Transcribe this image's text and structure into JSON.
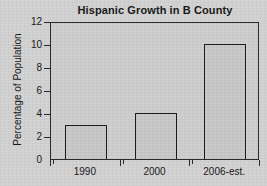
{
  "chart_data": {
    "type": "bar",
    "title": "Hispanic Growth in B County",
    "xlabel": "",
    "ylabel": "Percentage of Population",
    "categories": [
      "1990",
      "2000",
      "2006-est."
    ],
    "values": [
      3,
      4,
      10
    ],
    "ylim": [
      0,
      12
    ],
    "ytick_labels": [
      "0",
      "2",
      "4",
      "6",
      "8",
      "10",
      "12"
    ],
    "ytick_values": [
      0,
      2,
      4,
      6,
      8,
      10,
      12
    ],
    "grid": false,
    "legend": null,
    "bar_fill_color": "#c9c9c9",
    "bar_edge_color": "#1c1c1c",
    "plot_background_color": "#cfcfcf",
    "figure_background_color": "#d3d3d3",
    "axis_color": "#2b2b2b",
    "text_color": "#1a1a1a"
  }
}
